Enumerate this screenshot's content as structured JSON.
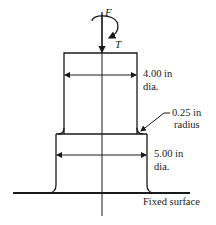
{
  "diagram": {
    "type": "stepped-shaft-under-load",
    "labels": {
      "force": "F",
      "torque": "T",
      "upper_dia_line1": "4.00 in",
      "upper_dia_line2": "dia.",
      "fillet_line1": "0.25 in",
      "fillet_line2": "radius",
      "lower_dia_line1": "5.00 in",
      "lower_dia_line2": "dia.",
      "surface": "Fixed surface"
    },
    "dimensions": {
      "upper_diameter_in": 4.0,
      "lower_diameter_in": 5.0,
      "fillet_radius_in": 0.25
    },
    "colors": {
      "stroke": "#1a1a1a",
      "background": "#ffffff"
    }
  }
}
